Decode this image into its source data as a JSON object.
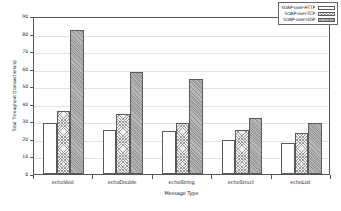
{
  "chart_data": {
    "type": "bar",
    "title": "",
    "xlabel": "Message Type",
    "ylabel": "Total Throughput (transactions/s)",
    "categories": [
      "echoVoid",
      "echoDouble",
      "echoString",
      "echoStruct",
      "echoList"
    ],
    "series": [
      {
        "name": "SOAP-over-HTTP",
        "values": [
          29,
          25,
          24.5,
          19.5,
          17.5
        ],
        "pattern": "empty"
      },
      {
        "name": "SOAP-over-TCP",
        "values": [
          36,
          34,
          29,
          25,
          23.5
        ],
        "pattern": "light-hatch"
      },
      {
        "name": "SOAP-over-UDP",
        "values": [
          82,
          58,
          54,
          32,
          29
        ],
        "pattern": "dark-hatch"
      }
    ],
    "ylim": [
      0,
      90
    ],
    "yticks": [
      0,
      10,
      20,
      30,
      40,
      50,
      60,
      70,
      80,
      90
    ],
    "ytick_labels": [
      "0",
      "10",
      "20",
      "30",
      "40",
      "50",
      "60",
      "70",
      "80",
      "90"
    ],
    "grid": true,
    "legend_position": "top-right"
  },
  "legend": {
    "entries": [
      {
        "label": "SOAP-over-HTTP"
      },
      {
        "label": "SOAP-over-TCP"
      },
      {
        "label": "SOAP-over-UDP"
      }
    ]
  }
}
